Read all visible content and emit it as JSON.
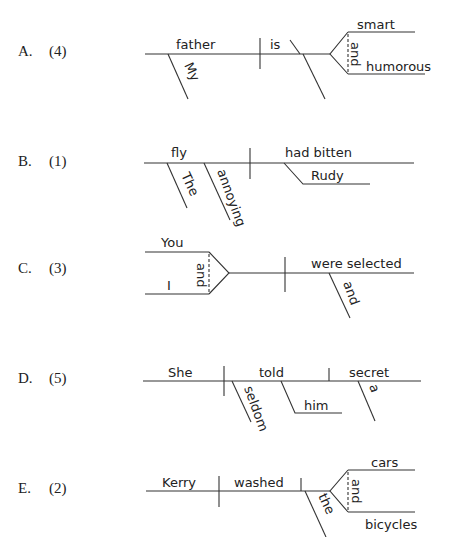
{
  "items": [
    {
      "letter": "A.",
      "number": "(4)",
      "words": {
        "subject": "father",
        "subject_modifier": "My",
        "verb": "is",
        "complement_top": "smart",
        "complement_bottom": "humorous",
        "conjunction": "and"
      }
    },
    {
      "letter": "B.",
      "number": "(1)",
      "words": {
        "subject": "fly",
        "modifier_1": "The",
        "modifier_2": "annoying",
        "verb": "had bitten",
        "object": "Rudy"
      }
    },
    {
      "letter": "C.",
      "number": "(3)",
      "words": {
        "subject_top": "You",
        "subject_bottom": "I",
        "conjunction": "and",
        "verb": "were selected",
        "verb_modifier": "and"
      }
    },
    {
      "letter": "D.",
      "number": "(5)",
      "words": {
        "subject": "She",
        "verb": "told",
        "adverb": "seldom",
        "indirect_object": "him",
        "direct_object": "secret",
        "article": "a"
      }
    },
    {
      "letter": "E.",
      "number": "(2)",
      "words": {
        "subject": "Kerry",
        "verb": "washed",
        "article": "the",
        "object_top": "cars",
        "object_bottom": "bicycles",
        "conjunction": "and"
      }
    }
  ]
}
